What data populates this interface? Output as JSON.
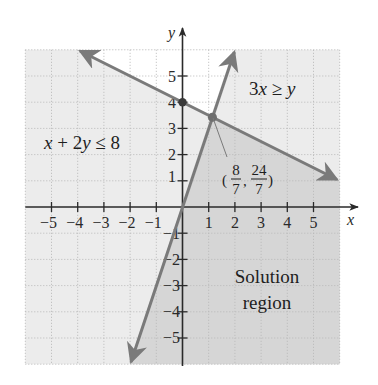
{
  "figure": {
    "axes": {
      "x_label": "x",
      "y_label": "y",
      "x_ticks": [
        "−5",
        "−4",
        "−3",
        "−2",
        "−1",
        "1",
        "2",
        "3",
        "4",
        "5"
      ],
      "y_ticks_positive": [
        "1",
        "2",
        "3",
        "4",
        "5"
      ],
      "y_ticks_negative": [
        "−1",
        "−2",
        "−3",
        "−4",
        "−5"
      ],
      "range": {
        "x": [
          -6,
          6
        ],
        "y": [
          -6,
          6
        ]
      },
      "grid": "dotted"
    },
    "inequalities": [
      {
        "text_parts": [
          "x",
          " + 2",
          "y",
          " ≤ 8"
        ],
        "label": "x + 2y ≤ 8",
        "boundary": "x + 2y = 8"
      },
      {
        "text_parts": [
          "3",
          "x",
          " ≥ ",
          "y"
        ],
        "label": "3x ≥ y",
        "boundary": "y = 3x"
      }
    ],
    "intersection": {
      "x_num": "8",
      "x_den": "7",
      "y_num": "24",
      "y_den": "7",
      "label": "(8/7, 24/7)",
      "open_paren": "(",
      "close_paren": ")",
      "comma": ","
    },
    "marked_point": {
      "x": 0,
      "y": 4
    },
    "solution_label": {
      "line1": "Solution",
      "line2": "region"
    },
    "colors": {
      "solution_fill": "#d6d6d6",
      "half_plane_fill": "#ececec",
      "unshaded": "#ffffff",
      "boundary_line": "#7a7a7a",
      "axis": "#2a2a2a",
      "grid": "#b8b8b8"
    }
  }
}
